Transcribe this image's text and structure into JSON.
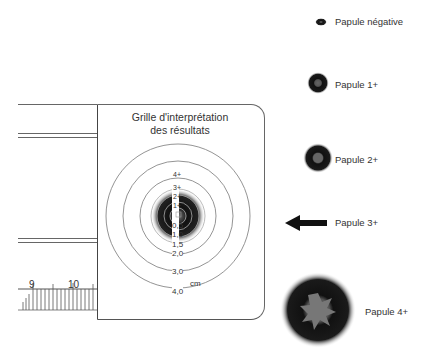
{
  "grid": {
    "title_line1": "Grille d'interprétation",
    "title_line2": "des résultats",
    "unit": "cm",
    "ring_labels": [
      "0,5",
      "1,0",
      "1,5",
      "2,0",
      "3,0",
      "4,0"
    ],
    "grade_labels": [
      "1+",
      "2+",
      "3+",
      "4+"
    ]
  },
  "ruler": {
    "labels": [
      "9",
      "10"
    ]
  },
  "legend": {
    "items": [
      {
        "label": "Papule négative"
      },
      {
        "label": "Papule 1+"
      },
      {
        "label": "Papule 2+"
      },
      {
        "label": "Papule 3+"
      },
      {
        "label": "Papule 4+"
      }
    ]
  }
}
